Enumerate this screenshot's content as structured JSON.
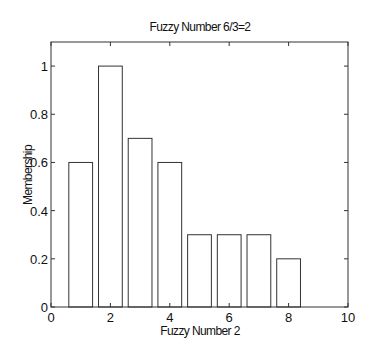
{
  "chart_data": {
    "type": "bar",
    "title": "Fuzzy Number 6/3=2",
    "xlabel": "Fuzzy Number 2",
    "ylabel": "Membership",
    "x": [
      1,
      2,
      3,
      4,
      5,
      6,
      7,
      8
    ],
    "values": [
      0.6,
      1.0,
      0.7,
      0.6,
      0.3,
      0.3,
      0.3,
      0.2
    ],
    "bar_width": 0.8,
    "xlim": [
      0,
      10
    ],
    "ylim": [
      0,
      1.1
    ],
    "xticks": [
      0,
      2,
      4,
      6,
      8,
      10
    ],
    "xtick_labels": [
      "0",
      "2",
      "4",
      "6",
      "8",
      "10"
    ],
    "yticks": [
      0,
      0.2,
      0.4,
      0.6,
      0.8,
      1
    ],
    "ytick_labels": [
      "0",
      "0.2",
      "0.4",
      "0.6",
      "0.8",
      "1"
    ],
    "grid": false,
    "legend": null,
    "bar_fill": "#ffffff",
    "bar_edge": "#333333"
  }
}
